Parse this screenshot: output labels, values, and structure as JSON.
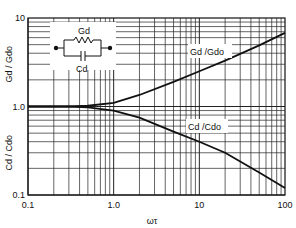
{
  "chart_data": {
    "type": "line",
    "title": "",
    "xlabel": "ωτ",
    "ylabel_top": "Gd / Gdo",
    "ylabel_bottom": "Cd / Cdo",
    "xscale": "log",
    "yscale": "log",
    "xlim": [
      0.1,
      100
    ],
    "ylim": [
      0.1,
      10
    ],
    "xticks": [
      "0.1",
      "1.0",
      "10",
      "100"
    ],
    "yticks": [
      "0.1",
      "1.0",
      "10"
    ],
    "grid": true,
    "series": [
      {
        "name": "Gd/Gdo",
        "x": [
          0.1,
          0.3,
          0.5,
          1,
          2,
          5,
          10,
          20,
          50,
          100
        ],
        "values": [
          1.0,
          1.0,
          1.02,
          1.1,
          1.35,
          1.9,
          2.5,
          3.3,
          4.9,
          6.8
        ]
      },
      {
        "name": "Cd/Cdo",
        "x": [
          0.1,
          0.3,
          0.5,
          1,
          2,
          5,
          10,
          20,
          50,
          100
        ],
        "values": [
          1.0,
          1.0,
          0.98,
          0.9,
          0.75,
          0.52,
          0.4,
          0.3,
          0.18,
          0.12
        ]
      }
    ],
    "annotations": [
      "Gd",
      "Cd",
      "Gd /Gdo",
      "Cd /Cdo"
    ]
  },
  "inset": {
    "resistor_label": "Gd",
    "capacitor_label": "Cd"
  }
}
